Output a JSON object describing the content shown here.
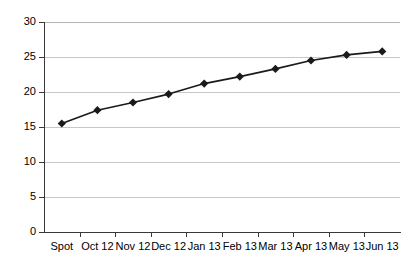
{
  "chart_data": {
    "type": "line",
    "title": "",
    "subtitle": "",
    "xlabel": "",
    "ylabel": "",
    "categories": [
      "Spot",
      "Oct 12",
      "Nov 12",
      "Dec 12",
      "Jan 13",
      "Feb 13",
      "Mar 13",
      "Apr 13",
      "May 13",
      "Jun 13"
    ],
    "values": [
      15.5,
      17.4,
      18.5,
      19.7,
      21.2,
      22.2,
      23.3,
      24.5,
      25.3,
      25.8
    ],
    "ylim": [
      0,
      30
    ],
    "ytick_labels": [
      "0",
      "5",
      "10",
      "15",
      "20",
      "25",
      "30"
    ],
    "ytick_values": [
      0,
      5,
      10,
      15,
      20,
      25,
      30
    ],
    "grid": true,
    "legend": "none",
    "series_color": "#1a1a1a",
    "grid_color": "#c8c8c8",
    "axis_color": "#3a3a3a",
    "marker": "diamond",
    "background": "#ffffff"
  }
}
